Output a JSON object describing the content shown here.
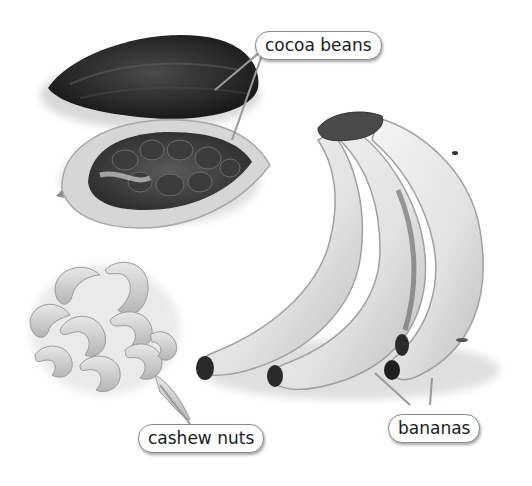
{
  "figure": {
    "type": "labeled-photo-illustration",
    "color_mode": "grayscale",
    "labels": [
      {
        "id": "cocoa",
        "text": "cocoa beans"
      },
      {
        "id": "cashew",
        "text": "cashew nuts"
      },
      {
        "id": "bananas",
        "text": "bananas"
      }
    ]
  }
}
